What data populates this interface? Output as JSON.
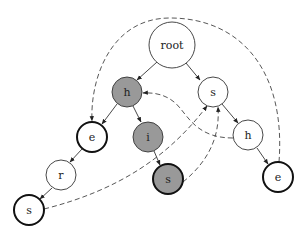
{
  "diagram": {
    "type": "trie with suffix links",
    "colors": {
      "highlight_fill": "#999999",
      "node_fill": "#ffffff",
      "stroke": "#333333",
      "thick_stroke": "#111111"
    },
    "nodes": [
      {
        "id": "root",
        "label": "root",
        "x": 172,
        "y": 45,
        "r": 23,
        "fill": "#ffffff",
        "thick": false
      },
      {
        "id": "h1",
        "label": "h",
        "x": 127,
        "y": 92,
        "r": 15,
        "fill": "#999999",
        "thick": false
      },
      {
        "id": "s1",
        "label": "s",
        "x": 213,
        "y": 92,
        "r": 15,
        "fill": "#ffffff",
        "thick": false
      },
      {
        "id": "e1",
        "label": "e",
        "x": 92,
        "y": 137,
        "r": 15,
        "fill": "#ffffff",
        "thick": true
      },
      {
        "id": "i1",
        "label": "i",
        "x": 148,
        "y": 137,
        "r": 15,
        "fill": "#999999",
        "thick": false
      },
      {
        "id": "h2",
        "label": "h",
        "x": 248,
        "y": 135,
        "r": 15,
        "fill": "#ffffff",
        "thick": false
      },
      {
        "id": "r1",
        "label": "r",
        "x": 61,
        "y": 175,
        "r": 15,
        "fill": "#ffffff",
        "thick": false
      },
      {
        "id": "s2",
        "label": "s",
        "x": 168,
        "y": 179,
        "r": 15,
        "fill": "#999999",
        "thick": true
      },
      {
        "id": "e2",
        "label": "e",
        "x": 278,
        "y": 177,
        "r": 15,
        "fill": "#ffffff",
        "thick": true
      },
      {
        "id": "s3",
        "label": "s",
        "x": 29,
        "y": 210,
        "r": 15,
        "fill": "#ffffff",
        "thick": true
      }
    ],
    "edges": [
      {
        "from": "root",
        "to": "h1"
      },
      {
        "from": "root",
        "to": "s1"
      },
      {
        "from": "h1",
        "to": "e1"
      },
      {
        "from": "h1",
        "to": "i1"
      },
      {
        "from": "s1",
        "to": "h2"
      },
      {
        "from": "e1",
        "to": "r1"
      },
      {
        "from": "i1",
        "to": "s2"
      },
      {
        "from": "h2",
        "to": "e2"
      },
      {
        "from": "r1",
        "to": "s3"
      }
    ],
    "suffix_links": [
      {
        "from": "e2",
        "to": "e1"
      },
      {
        "from": "h2",
        "to": "h1"
      },
      {
        "from": "s2",
        "to": "s1"
      },
      {
        "from": "s3",
        "to": "s1"
      }
    ]
  }
}
